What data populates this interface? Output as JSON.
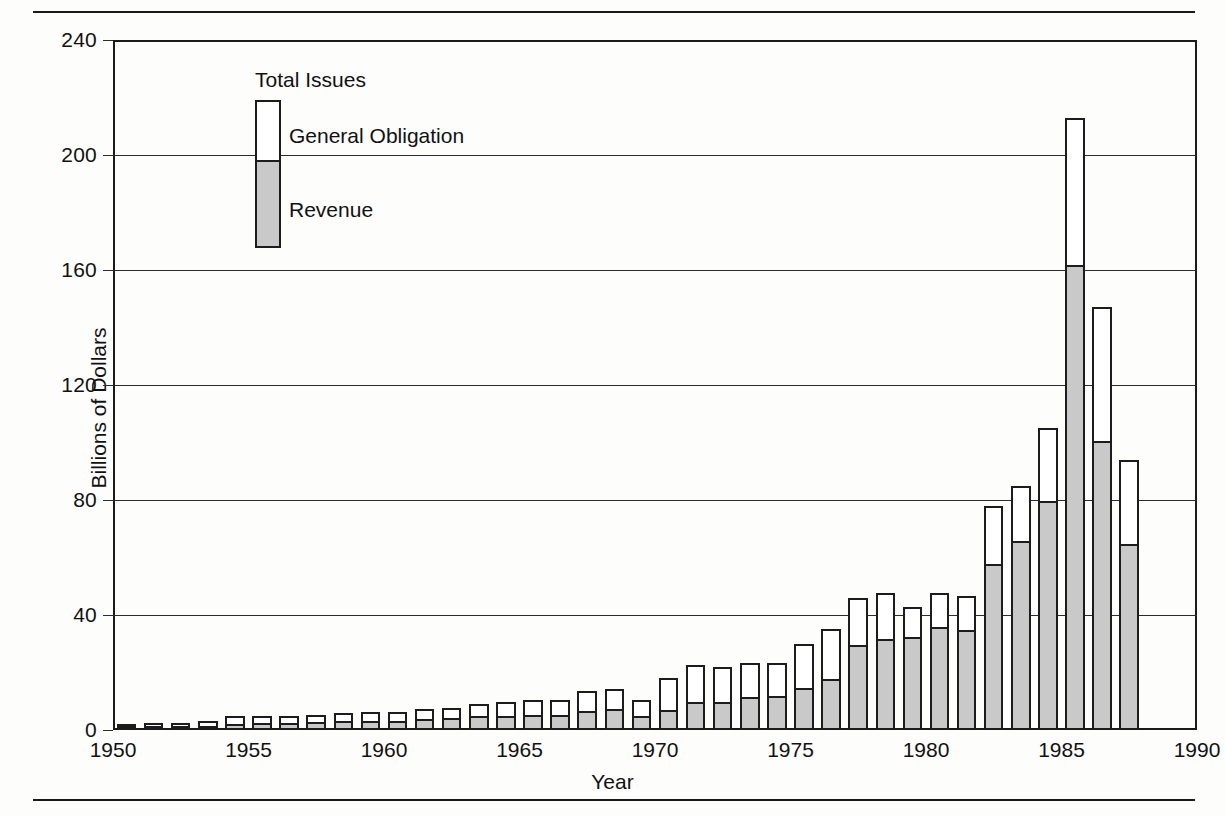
{
  "legend": {
    "title": "Total Issues",
    "general_obligation": "General Obligation",
    "revenue": "Revenue"
  },
  "axes": {
    "ylabel": "Billions of Dollars",
    "xlabel": "Year"
  },
  "chart_data": {
    "type": "bar",
    "stacked": true,
    "title": "",
    "xlabel": "Year",
    "ylabel": "Billions of Dollars",
    "xlim": [
      1950,
      1990
    ],
    "ylim": [
      0,
      240
    ],
    "ytick_labels": [
      "0",
      "40",
      "80",
      "120",
      "160",
      "200",
      "240"
    ],
    "yticks": [
      0,
      40,
      80,
      120,
      160,
      200,
      240
    ],
    "xtick_labels": [
      "1950",
      "1955",
      "1960",
      "1965",
      "1970",
      "1975",
      "1980",
      "1985",
      "1990"
    ],
    "xticks": [
      1950,
      1955,
      1960,
      1965,
      1970,
      1975,
      1980,
      1985,
      1990
    ],
    "grid": true,
    "legend_position": "upper-left-inside",
    "colors": {
      "general_obligation": "#ffffff",
      "revenue": "#c9c9c9",
      "outline": "#1c1c1c"
    },
    "categories": [
      1950,
      1951,
      1952,
      1953,
      1954,
      1955,
      1956,
      1957,
      1958,
      1959,
      1960,
      1961,
      1962,
      1963,
      1964,
      1965,
      1966,
      1967,
      1968,
      1969,
      1970,
      1971,
      1972,
      1973,
      1974,
      1975,
      1976,
      1977,
      1978,
      1979,
      1980,
      1981,
      1982,
      1983,
      1984,
      1985,
      1986,
      1987
    ],
    "series": [
      {
        "name": "Revenue",
        "values": [
          0.3,
          0.4,
          0.5,
          0.6,
          1.5,
          1.6,
          1.7,
          2.0,
          2.6,
          2.3,
          2.4,
          3.0,
          3.6,
          4.1,
          4.2,
          4.4,
          4.5,
          6.0,
          6.6,
          4.3,
          6.3,
          9.1,
          9.2,
          10.9,
          11.2,
          13.9,
          17.1,
          28.9,
          30.8,
          31.7,
          35.2,
          34.2,
          57.0,
          65.0,
          79.0,
          161.0,
          100.0,
          64.0
        ]
      },
      {
        "name": "General Obligation",
        "values": [
          1.9,
          2.0,
          2.1,
          2.6,
          3.3,
          3.3,
          3.2,
          3.2,
          3.4,
          3.9,
          3.9,
          4.2,
          4.0,
          5.1,
          5.5,
          6.0,
          6.1,
          7.4,
          7.8,
          6.3,
          11.8,
          13.6,
          12.7,
          12.3,
          12.1,
          16.1,
          18.0,
          17.0,
          17.0,
          11.0,
          12.4,
          12.5,
          20.9,
          20.0,
          26.0,
          52.0,
          47.0,
          30.0
        ]
      }
    ],
    "totals": [
      2.2,
      2.4,
      2.6,
      3.2,
      4.8,
      4.9,
      4.9,
      5.2,
      6.0,
      6.2,
      6.3,
      7.2,
      7.6,
      9.2,
      9.7,
      10.4,
      10.6,
      13.4,
      14.4,
      10.6,
      18.1,
      22.7,
      21.9,
      23.2,
      23.3,
      30.0,
      35.1,
      45.9,
      47.8,
      42.7,
      47.6,
      46.7,
      77.9,
      85.0,
      105.0,
      213.0,
      147.0,
      94.0
    ]
  }
}
